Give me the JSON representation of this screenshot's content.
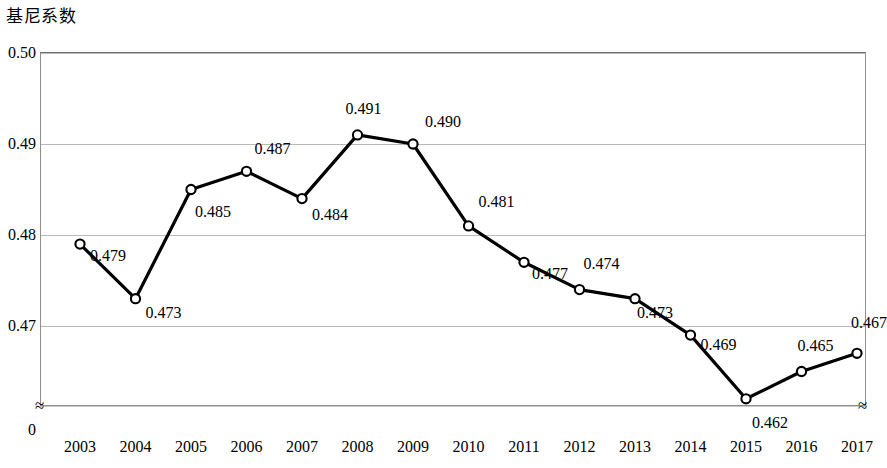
{
  "chart_data": {
    "type": "line",
    "title": "",
    "ylabel": "基尼系数",
    "xlabel": "",
    "categories": [
      "2003",
      "2004",
      "2005",
      "2006",
      "2007",
      "2008",
      "2009",
      "2010",
      "2011",
      "2012",
      "2013",
      "2014",
      "2015",
      "2016",
      "2017"
    ],
    "values": [
      0.479,
      0.473,
      0.485,
      0.487,
      0.484,
      0.491,
      0.49,
      0.481,
      0.477,
      0.474,
      0.473,
      0.469,
      0.462,
      0.465,
      0.467
    ],
    "point_labels": [
      "0.479",
      "0.473",
      "0.485",
      "0.487",
      "0.484",
      "0.491",
      "0.490",
      "0.481",
      "0.477",
      "0.474",
      "0.473",
      "0.469",
      "0.462",
      "0.465",
      "0.467"
    ],
    "ytick_labels": [
      "0.50",
      "0.49",
      "0.48",
      "0.47",
      "0"
    ],
    "ytick_values": [
      0.5,
      0.49,
      0.48,
      0.47,
      0.0
    ],
    "ylim": [
      0.4605,
      0.5
    ],
    "grid": true,
    "legend": null,
    "axis_break": "≈",
    "series_color": "#000000",
    "grid_color": "#b9b9b9",
    "marker": "open-circle"
  }
}
